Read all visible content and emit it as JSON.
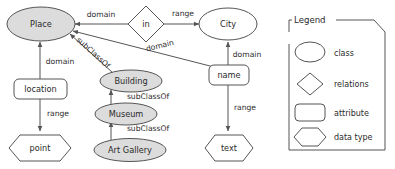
{
  "diagram": {
    "colors": {
      "class_fill": "#dcdcdc",
      "plain_fill": "#ffffff",
      "stroke": "#555555",
      "text": "#2a2a2a"
    },
    "nodes": [
      {
        "id": "place",
        "label": "Place",
        "shape": "ellipse",
        "kind": "class",
        "filled": true
      },
      {
        "id": "city",
        "label": "City",
        "shape": "ellipse",
        "kind": "class",
        "filled": false
      },
      {
        "id": "in",
        "label": "in",
        "shape": "diamond",
        "kind": "relations",
        "filled": false
      },
      {
        "id": "building",
        "label": "Building",
        "shape": "ellipse",
        "kind": "class",
        "filled": true
      },
      {
        "id": "museum",
        "label": "Museum",
        "shape": "ellipse",
        "kind": "class",
        "filled": true
      },
      {
        "id": "art_gallery",
        "label": "Art Gallery",
        "shape": "ellipse",
        "kind": "class",
        "filled": true
      },
      {
        "id": "location",
        "label": "location",
        "shape": "roundrect",
        "kind": "attribute",
        "filled": false
      },
      {
        "id": "name",
        "label": "name",
        "shape": "roundrect",
        "kind": "attribute",
        "filled": false
      },
      {
        "id": "point",
        "label": "point",
        "shape": "hexagon",
        "kind": "datatype",
        "filled": false
      },
      {
        "id": "text",
        "label": "text",
        "shape": "hexagon",
        "kind": "datatype",
        "filled": false
      }
    ],
    "edges": [
      {
        "id": "e1",
        "from": "in",
        "to": "place",
        "label": "domain"
      },
      {
        "id": "e2",
        "from": "in",
        "to": "city",
        "label": "range"
      },
      {
        "id": "e3",
        "from": "name",
        "to": "place",
        "label": "domain"
      },
      {
        "id": "e4",
        "from": "name",
        "to": "city",
        "label": "domain"
      },
      {
        "id": "e5",
        "from": "name",
        "to": "text",
        "label": "range"
      },
      {
        "id": "e6",
        "from": "building",
        "to": "place",
        "label": "subClassOf"
      },
      {
        "id": "e7",
        "from": "museum",
        "to": "building",
        "label": "subClassOf"
      },
      {
        "id": "e8",
        "from": "art_gallery",
        "to": "museum",
        "label": "subClassOf"
      },
      {
        "id": "e9",
        "from": "location",
        "to": "place",
        "label": "domain"
      },
      {
        "id": "e10",
        "from": "location",
        "to": "point",
        "label": "range"
      }
    ],
    "edge_labels": {
      "in_place": "domain",
      "in_city": "range",
      "name_place": "domain",
      "name_city": "domain",
      "name_text": "range",
      "building_place": "subClassOf",
      "museum_building": "subClassOf",
      "artgallery_museum": "subClassOf",
      "location_place": "domain",
      "location_point": "range"
    },
    "node_labels": {
      "place": "Place",
      "city": "City",
      "in": "in",
      "building": "Building",
      "museum": "Museum",
      "art_gallery": "Art Gallery",
      "location": "location",
      "name": "name",
      "point": "point",
      "text": "text"
    }
  },
  "legend": {
    "title": "Legend",
    "items": [
      {
        "shape": "ellipse",
        "label": "class"
      },
      {
        "shape": "diamond",
        "label": "relations"
      },
      {
        "shape": "roundrect",
        "label": "attribute"
      },
      {
        "shape": "hexagon",
        "label": "data type"
      }
    ],
    "labels": {
      "class": "class",
      "relations": "relations",
      "attribute": "attribute",
      "datatype": "data type"
    }
  }
}
